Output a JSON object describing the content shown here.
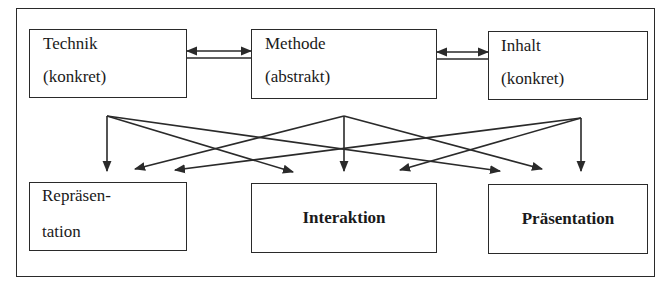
{
  "diagram": {
    "top_boxes": [
      {
        "id": "technik",
        "line1": "Technik",
        "line2": "(konkret)"
      },
      {
        "id": "methode",
        "line1": "Methode",
        "line2": "(abstrakt)"
      },
      {
        "id": "inhalt",
        "line1": "Inhalt",
        "line2": "(konkret)"
      }
    ],
    "bottom_boxes": [
      {
        "id": "repraesentation",
        "line1": "Repräsen-",
        "line2": "tation",
        "bold": false
      },
      {
        "id": "interaktion",
        "label": "Interaktion",
        "bold": true
      },
      {
        "id": "praesentation",
        "label": "Präsentation",
        "bold": true
      }
    ],
    "connections": {
      "top_links": [
        {
          "from": "technik",
          "to": "methode",
          "type": "bidirectional"
        },
        {
          "from": "methode",
          "to": "inhalt",
          "type": "bidirectional"
        }
      ],
      "fan_out": [
        {
          "from": "technik",
          "to": [
            "repraesentation",
            "interaktion",
            "praesentation"
          ]
        },
        {
          "from": "methode",
          "to": [
            "repraesentation",
            "interaktion",
            "praesentation"
          ]
        },
        {
          "from": "inhalt",
          "to": [
            "repraesentation",
            "interaktion",
            "praesentation"
          ]
        }
      ]
    },
    "colors": {
      "line": "#2a2a2a",
      "background": "#ffffff"
    }
  }
}
